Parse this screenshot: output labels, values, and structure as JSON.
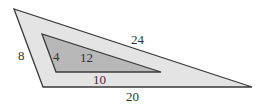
{
  "diagram": {
    "outer_triangle": {
      "points": "14,9 43,87 252,87",
      "fill": "#e4e4e4",
      "stroke": "#3a3a3a",
      "labels": {
        "left": "8",
        "top": "24",
        "bottom": "20"
      }
    },
    "inner_triangle": {
      "points": "42,34 56,72 161,72",
      "fill": "#b8b8b8",
      "stroke": "#3a3a3a",
      "labels": {
        "left": "4",
        "top": "12",
        "bottom": "10"
      }
    }
  }
}
